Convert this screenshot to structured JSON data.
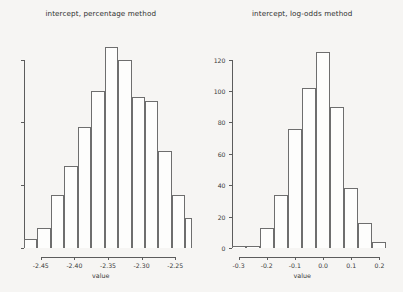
{
  "figure": {
    "background": "#f6f5f3",
    "ink": "#5c5c5c"
  },
  "chart_data": [
    {
      "type": "bar",
      "panel": "left",
      "title": "intercept, percentage method",
      "xlabel": "value",
      "ylabel": "",
      "xlim": [
        -2.475,
        -2.225
      ],
      "ylim": [
        0,
        130
      ],
      "xticks": [
        "-2.45",
        "-2.40",
        "-2.35",
        "-2.30",
        "-2.25"
      ],
      "xtick_values": [
        -2.45,
        -2.4,
        -2.35,
        -2.3,
        -2.25
      ],
      "yticks": [],
      "ytick_values": [
        0,
        40,
        80,
        120
      ],
      "ytick_labels_visible": false,
      "grid": false,
      "legend": null,
      "bin_width": 0.02,
      "bin_edges": [
        -2.475,
        -2.455,
        -2.435,
        -2.415,
        -2.395,
        -2.375,
        -2.355,
        -2.335,
        -2.315,
        -2.295,
        -2.275,
        -2.255,
        -2.235,
        -2.225
      ],
      "categories": [
        "-2.465",
        "-2.445",
        "-2.425",
        "-2.405",
        "-2.385",
        "-2.365",
        "-2.345",
        "-2.325",
        "-2.305",
        "-2.285",
        "-2.265",
        "-2.245",
        "-2.230"
      ],
      "values": [
        6,
        13,
        34,
        52,
        77,
        100,
        128,
        120,
        96,
        94,
        62,
        34,
        19
      ]
    },
    {
      "type": "bar",
      "panel": "right",
      "title": "intercept, log-odds method",
      "xlabel": "value",
      "ylabel": "",
      "xlim": [
        -0.325,
        0.25
      ],
      "ylim": [
        0,
        130
      ],
      "xticks": [
        "-0.3",
        "-0.2",
        "-0.1",
        "0.0",
        "0.1",
        "0.2"
      ],
      "xtick_values": [
        -0.3,
        -0.2,
        -0.1,
        0.0,
        0.1,
        0.2
      ],
      "yticks": [
        "0",
        "20",
        "40",
        "60",
        "80",
        "100",
        "120"
      ],
      "ytick_values": [
        0,
        20,
        40,
        60,
        80,
        100,
        120
      ],
      "ytick_labels_visible": true,
      "grid": false,
      "legend": null,
      "bin_width": 0.05,
      "bin_edges": [
        -0.325,
        -0.275,
        -0.225,
        -0.175,
        -0.125,
        -0.075,
        -0.025,
        0.025,
        0.075,
        0.125,
        0.175,
        0.225
      ],
      "categories": [
        "-0.30",
        "-0.25",
        "-0.20",
        "-0.15",
        "-0.10",
        "-0.05",
        "0.00",
        "0.05",
        "0.10",
        "0.15",
        "0.20"
      ],
      "values": [
        1,
        1,
        13,
        34,
        76,
        102,
        125,
        90,
        38,
        16,
        4
      ]
    }
  ]
}
